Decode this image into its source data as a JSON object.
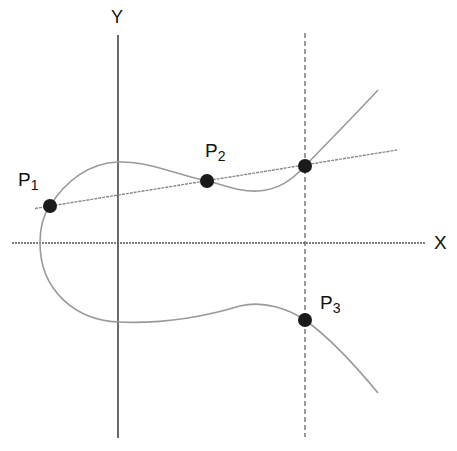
{
  "diagram": {
    "axes": {
      "x_label": "X",
      "y_label": "Y"
    },
    "points": [
      {
        "name": "P",
        "sub": "1",
        "x": 50,
        "y": 206
      },
      {
        "name": "P",
        "sub": "2",
        "x": 207,
        "y": 181
      },
      {
        "name": "",
        "sub": "",
        "x": 305,
        "y": 166
      },
      {
        "name": "P",
        "sub": "3",
        "x": 305,
        "y": 320
      }
    ],
    "colors": {
      "axis": "#333333",
      "curve": "#9a9a9a",
      "secant": "#8a8a8a",
      "point": "#1a1a1a",
      "text": "#111111"
    }
  }
}
